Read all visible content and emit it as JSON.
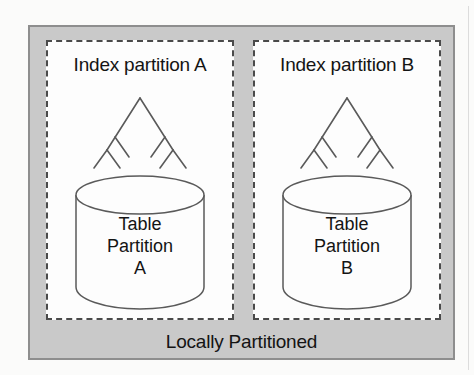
{
  "diagram": {
    "caption": "Locally Partitioned",
    "panels": [
      {
        "id": "a",
        "title": "Index partition A",
        "index_icon": "btree-index-icon",
        "table_icon": "database-cylinder-icon",
        "table_label_line1": "Table",
        "table_label_line2": "Partition",
        "table_label_line3": "A"
      },
      {
        "id": "b",
        "title": "Index partition B",
        "index_icon": "btree-index-icon",
        "table_icon": "database-cylinder-icon",
        "table_label_line1": "Table",
        "table_label_line2": "Partition",
        "table_label_line3": "B"
      }
    ],
    "colors": {
      "outer_fill": "#c9c9c9",
      "outer_border": "#8e8e8e",
      "panel_fill": "#fdfdfd",
      "panel_border": "#4a4a4a",
      "stroke": "#5a5a5a",
      "text": "#141414"
    }
  }
}
